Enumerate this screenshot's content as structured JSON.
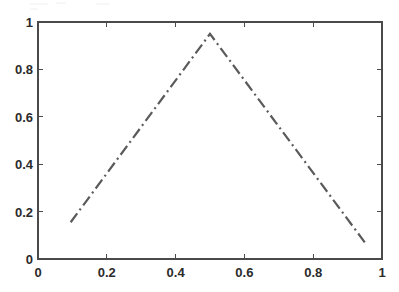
{
  "chart_data": {
    "type": "line",
    "title": "",
    "xlabel": "",
    "ylabel": "",
    "xlim": [
      0,
      1
    ],
    "ylim": [
      0,
      1
    ],
    "xticks": [
      0,
      0.2,
      0.4,
      0.6,
      0.8,
      1
    ],
    "xtick_labels": [
      "0",
      "0.2",
      "0.4",
      "0.6",
      "0.8",
      "1"
    ],
    "yticks": [
      0,
      0.2,
      0.4,
      0.6,
      0.8,
      1
    ],
    "ytick_labels": [
      "0",
      "0.2",
      "0.4",
      "0.6",
      "0.8",
      "1"
    ],
    "grid": false,
    "legend": null,
    "box": true,
    "tick_direction": "in",
    "series": [
      {
        "name": "triangular function",
        "line_style": "dash-dot",
        "line_color": "#5a5a5a",
        "line_width": 2.2,
        "x": [
          0.095,
          0.5,
          0.95
        ],
        "y": [
          0.155,
          0.95,
          0.07
        ]
      }
    ],
    "annotations": []
  },
  "axes": {
    "frame_color": "#4a4a4a",
    "background": "#ffffff",
    "tick_length": 5
  },
  "figure": {
    "background": "#ffffff",
    "width": 399,
    "height": 292
  }
}
